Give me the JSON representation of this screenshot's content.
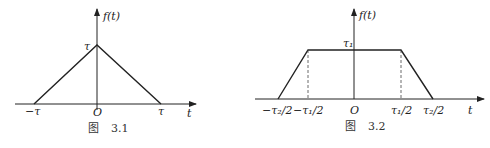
{
  "figures": [
    {
      "caption_prefix": "图",
      "caption_number": "3.1",
      "y_axis_label": "f(t)",
      "x_axis_label": "t",
      "origin_label": "O",
      "peak_label": "τ",
      "x_ticks": [
        "−τ",
        "τ"
      ],
      "shape": "triangle"
    },
    {
      "caption_prefix": "图",
      "caption_number": "3.2",
      "y_axis_label": "f(t)",
      "x_axis_label": "t",
      "origin_label": "O",
      "peak_label": "τ₁",
      "x_ticks": [
        "−τ₂/2",
        "−τ₁/2",
        "τ₁/2",
        "τ₂/2"
      ],
      "shape": "trapezoid"
    }
  ]
}
